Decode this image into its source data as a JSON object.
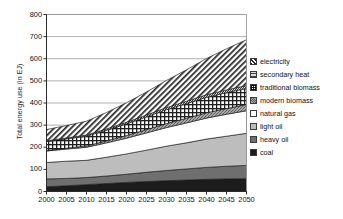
{
  "chart_data": {
    "type": "area",
    "title": "",
    "xlabel": "",
    "ylabel": "Total energy use (in EJ)",
    "xlim": [
      2000,
      2050
    ],
    "ylim": [
      0,
      800
    ],
    "grid": true,
    "stacked": true,
    "legend_position": "right",
    "x": [
      2000,
      2005,
      2010,
      2015,
      2020,
      2025,
      2030,
      2035,
      2040,
      2045,
      2050
    ],
    "categories": [
      "2000",
      "2005",
      "2010",
      "2015",
      "2020",
      "2025",
      "2030",
      "2035",
      "2040",
      "2045",
      "2050"
    ],
    "xtick_labels": [
      "2000",
      "2005",
      "2010",
      "2015",
      "2020",
      "2025",
      "2030",
      "2035",
      "2040",
      "2045",
      "2050"
    ],
    "ytick_labels": [
      "0",
      "100",
      "200",
      "300",
      "400",
      "500",
      "600",
      "700",
      "800"
    ],
    "ytick_values": [
      0,
      100,
      200,
      300,
      400,
      500,
      600,
      700,
      800
    ],
    "series": [
      {
        "name": "coal",
        "pattern": "solid-dark",
        "color": "#1c1c1c",
        "values": [
          22,
          26,
          31,
          36,
          41,
          45,
          49,
          52,
          55,
          57,
          58
        ]
      },
      {
        "name": "heavy oil",
        "pattern": "solid-mid-gray",
        "color": "#6f6f6f",
        "values": [
          35,
          33,
          32,
          34,
          37,
          42,
          46,
          50,
          54,
          57,
          60
        ]
      },
      {
        "name": "light oil",
        "pattern": "solid-light-gray",
        "color": "#bdbdbd",
        "values": [
          74,
          78,
          78,
          85,
          92,
          100,
          110,
          118,
          128,
          136,
          145
        ]
      },
      {
        "name": "natural gas",
        "pattern": "white",
        "color": "#ffffff",
        "values": [
          52,
          55,
          59,
          65,
          71,
          78,
          84,
          90,
          95,
          99,
          102
        ]
      },
      {
        "name": "modern biomass",
        "pattern": "speckle-gray",
        "color": "#9a9a9a",
        "values": [
          2,
          4,
          6,
          9,
          12,
          15,
          18,
          21,
          24,
          26,
          28
        ]
      },
      {
        "name": "traditional biomass",
        "pattern": "grid-check",
        "color": "#ffffff",
        "values": [
          41,
          42,
          44,
          48,
          53,
          58,
          63,
          67,
          70,
          72,
          73
        ]
      },
      {
        "name": "secondary heat",
        "pattern": "dotted-gray",
        "color": "#8a8a8a",
        "values": [
          3,
          4,
          5,
          6,
          7,
          8,
          9,
          10,
          11,
          12,
          13
        ]
      },
      {
        "name": "electricity",
        "pattern": "diagonal-hatch",
        "color": "#ffffff",
        "values": [
          51,
          56,
          63,
          74,
          88,
          104,
          123,
          142,
          164,
          186,
          207
        ]
      }
    ],
    "totals": [
      280,
      298,
      318,
      357,
      401,
      450,
      502,
      550,
      601,
      645,
      686
    ],
    "annotations": []
  },
  "legend": {
    "items": [
      {
        "label": "electricity",
        "swatch": "diagonal-hatch-swatch"
      },
      {
        "label": "secondary heat",
        "swatch": "dotted-gray-swatch"
      },
      {
        "label": "traditional biomass",
        "swatch": "grid-check-swatch"
      },
      {
        "label": "modern biomass",
        "swatch": "speckle-gray-swatch"
      },
      {
        "label": "natural gas",
        "swatch": "white-swatch"
      },
      {
        "label": "light oil",
        "swatch": "light-gray-swatch"
      },
      {
        "label": "heavy oil",
        "swatch": "mid-gray-swatch"
      },
      {
        "label": "coal",
        "swatch": "dark-swatch"
      }
    ]
  },
  "axis": {
    "y_title": "Total energy use (in EJ)"
  }
}
